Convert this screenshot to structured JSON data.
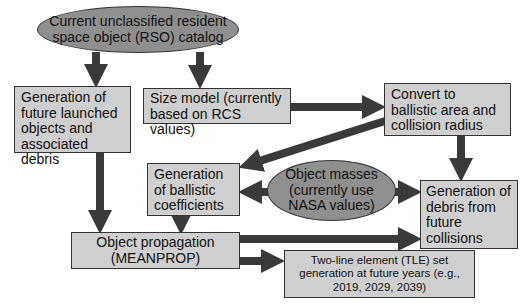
{
  "diagram": {
    "nodes": {
      "rso_catalog": {
        "label": "Current unclassified resident space object (RSO) catalog",
        "shape": "ellipse"
      },
      "future_launch": {
        "label": "Generation of future launched objects and associated debris",
        "shape": "box"
      },
      "size_model": {
        "label": "Size model (currently based on RCS values)",
        "shape": "box"
      },
      "convert_ballistic": {
        "label": "Convert to ballistic area and collision radius",
        "shape": "box"
      },
      "ballistic_coeff": {
        "label": "Generation of ballistic coefficients",
        "shape": "box"
      },
      "object_masses": {
        "label": "Object masses (currently use NASA values)",
        "shape": "ellipse"
      },
      "debris_collisions": {
        "label": "Generation of debris from future collisions",
        "shape": "box"
      },
      "propagation": {
        "label": "Object propagation (MEANPROP)",
        "shape": "box"
      },
      "tle_generation": {
        "label": "Two-line element (TLE) set generation at future years (e.g., 2019, 2029, 2039)",
        "shape": "box"
      }
    },
    "edges": [
      {
        "from": "rso_catalog",
        "to": "future_launch"
      },
      {
        "from": "rso_catalog",
        "to": "size_model"
      },
      {
        "from": "size_model",
        "to": "convert_ballistic"
      },
      {
        "from": "convert_ballistic",
        "to": "ballistic_coeff"
      },
      {
        "from": "convert_ballistic",
        "to": "debris_collisions"
      },
      {
        "from": "object_masses",
        "to": "ballistic_coeff"
      },
      {
        "from": "object_masses",
        "to": "debris_collisions"
      },
      {
        "from": "future_launch",
        "to": "propagation"
      },
      {
        "from": "ballistic_coeff",
        "to": "propagation"
      },
      {
        "from": "propagation",
        "to": "debris_collisions"
      },
      {
        "from": "propagation",
        "to": "tle_generation"
      }
    ],
    "colors": {
      "box_fill": "#cfcfcf",
      "ellipse_fill": "#8f8f8f",
      "arrow": "#3a3a3a",
      "border": "#333333"
    }
  }
}
